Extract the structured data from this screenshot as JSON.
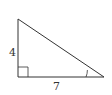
{
  "diagram": {
    "type": "right-triangle",
    "vertical_leg_label": "4",
    "horizontal_leg_label": "7",
    "right_angle_marker": true,
    "marked_angle": "angle at right vertex (opposite the vertical leg)",
    "colors": {
      "stroke": "#333333",
      "background": "#ffffff"
    }
  }
}
